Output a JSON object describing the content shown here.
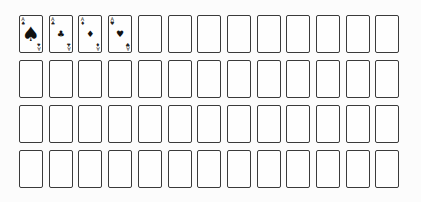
{
  "game": {
    "title": "Card layout",
    "rows": 4,
    "columns": 13
  },
  "suits": {
    "spades": "♠",
    "clubs": "♣",
    "diamonds": "♦",
    "hearts": "♥"
  },
  "cards": [
    {
      "row": 0,
      "col": 0,
      "face_up": true,
      "rank": "A",
      "suit": "spades",
      "suit_icon": "♠",
      "large_pip": true
    },
    {
      "row": 0,
      "col": 1,
      "face_up": true,
      "rank": "A",
      "suit": "clubs",
      "suit_icon": "♣",
      "large_pip": false
    },
    {
      "row": 0,
      "col": 2,
      "face_up": true,
      "rank": "A",
      "suit": "diamonds",
      "suit_icon": "♦",
      "large_pip": false
    },
    {
      "row": 0,
      "col": 3,
      "face_up": true,
      "rank": "A",
      "suit": "hearts",
      "suit_icon": "♥",
      "large_pip": false
    }
  ],
  "empty_slot_count": 48
}
